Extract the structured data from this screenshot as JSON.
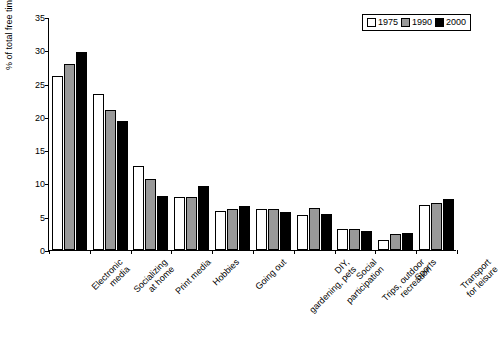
{
  "chart_data": {
    "type": "bar",
    "title": "",
    "xlabel": "",
    "ylabel": "% of total free time",
    "ylim": [
      0,
      35
    ],
    "yticks": [
      0,
      5,
      10,
      15,
      20,
      25,
      30,
      35
    ],
    "grid": false,
    "legend_position": "top-right",
    "categories": [
      "Electronic media",
      "Socializing at home",
      "Print media",
      "Hobbies",
      "Going out",
      "DIY, gardening, pets",
      "Social participation",
      "Trips, outdoor recreation",
      "Sports",
      "Transport for leisure"
    ],
    "category_lines": [
      [
        "Electronic",
        "media"
      ],
      [
        "Socializing",
        "at home"
      ],
      [
        "Print media"
      ],
      [
        "Hobbies"
      ],
      [
        "Going out"
      ],
      [
        "DIY,",
        "gardening, pets"
      ],
      [
        "Social",
        "participation"
      ],
      [
        "Trips, outdoor",
        "recreation"
      ],
      [
        "Sports"
      ],
      [
        "Transport",
        "for leisure"
      ]
    ],
    "series": [
      {
        "name": "1975",
        "color": "#ffffff",
        "values": [
          26.1,
          23.4,
          12.6,
          8.0,
          5.8,
          6.2,
          5.3,
          3.1,
          1.5,
          6.8
        ]
      },
      {
        "name": "1990",
        "color": "#999999",
        "values": [
          28.0,
          21.0,
          10.7,
          8.0,
          6.2,
          6.1,
          6.3,
          3.1,
          2.4,
          7.0
        ]
      },
      {
        "name": "2000",
        "color": "#000000",
        "values": [
          29.8,
          19.4,
          8.1,
          9.6,
          6.6,
          5.7,
          5.4,
          2.8,
          2.6,
          7.6
        ]
      }
    ]
  },
  "legend": {
    "entries": [
      "1975",
      "1990",
      "2000"
    ]
  }
}
